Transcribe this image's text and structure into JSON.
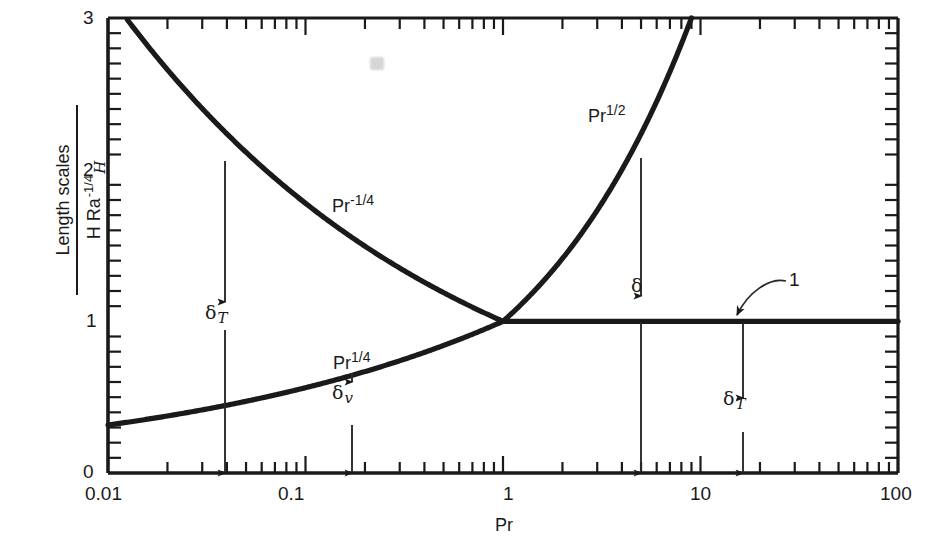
{
  "figure": {
    "background_color": "#ffffff",
    "line_color": "#1a1a1a"
  },
  "axes": {
    "x": {
      "label": "Pr",
      "scale": "log",
      "min": 0.01,
      "max": 100,
      "tick_labels": [
        "0.01",
        "0.1",
        "1",
        "10",
        "100"
      ],
      "tick_values": [
        0.01,
        0.1,
        1,
        10,
        100
      ]
    },
    "y": {
      "label_numerator": "Length scales",
      "label_denominator_base": "H Ra",
      "label_denominator_sub": "H",
      "label_denominator_sup": "-1/4",
      "scale": "linear",
      "min": 0,
      "max": 3,
      "tick_labels": [
        "0",
        "1",
        "2",
        "3"
      ],
      "tick_values": [
        0,
        1,
        2,
        3
      ]
    }
  },
  "curve_labels": {
    "upper": "Pr",
    "upper_exp": "-1/4",
    "lower": "Pr",
    "lower_exp": "1/4",
    "rising": "Pr",
    "rising_exp": "1/2"
  },
  "annotations": {
    "delta_T_left": "δ",
    "delta_T_left_sub": "T",
    "delta_v": "δ",
    "delta_v_sub": "v",
    "delta_mid": "δ",
    "delta_T_right": "δ",
    "delta_T_right_sub": "T",
    "unity_callout": "1"
  },
  "chart_data": {
    "type": "line",
    "title": "",
    "xlabel": "Pr",
    "ylabel": "Length scales / (H Ra_H^-1/4)",
    "xscale": "log",
    "yscale": "linear",
    "xlim": [
      0.01,
      100
    ],
    "ylim": [
      0,
      3
    ],
    "grid": false,
    "legend": "inline-curve-labels",
    "xtick_labels": [
      "0.01",
      "0.1",
      "1",
      "10",
      "100"
    ],
    "ytick_labels": [
      "0",
      "1",
      "2",
      "3"
    ],
    "series": [
      {
        "name": "Pr^-1/4",
        "formula": "y = Pr^(-1/4)",
        "role": "thermal boundary layer scale (low Pr branch)",
        "x": [
          0.01,
          0.0123,
          0.0152,
          0.0187,
          0.0231,
          0.0285,
          0.0352,
          0.0434,
          0.0536,
          0.0661,
          0.0816,
          0.1,
          0.155,
          0.239,
          0.369,
          0.57,
          0.88,
          1.0
        ],
        "y": [
          3.162,
          3.0,
          2.849,
          2.704,
          2.566,
          2.434,
          2.309,
          2.19,
          2.078,
          1.972,
          1.871,
          1.778,
          1.594,
          1.43,
          1.283,
          1.151,
          1.032,
          1.0
        ],
        "visible_from_x": 0.0123,
        "visible_to_x": 1.0
      },
      {
        "name": "Pr^1/4",
        "formula": "y = Pr^(1/4)",
        "role": "viscous boundary layer scale (low Pr branch)",
        "x": [
          0.01,
          0.0178,
          0.0316,
          0.0562,
          0.1,
          0.178,
          0.316,
          0.562,
          1.0
        ],
        "y": [
          0.316,
          0.365,
          0.422,
          0.487,
          0.562,
          0.649,
          0.75,
          0.866,
          1.0
        ],
        "visible_from_x": 0.01,
        "visible_to_x": 1.0
      },
      {
        "name": "Pr^1/2",
        "formula": "y = Pr^(1/2)",
        "role": "viscous boundary layer scale (high Pr branch)",
        "x": [
          1.0,
          1.5,
          2.0,
          3.0,
          4.0,
          5.0,
          6.0,
          7.0,
          8.0,
          9.0
        ],
        "y": [
          1.0,
          1.225,
          1.414,
          1.732,
          2.0,
          2.236,
          2.449,
          2.646,
          2.828,
          3.0
        ],
        "visible_from_x": 1.0,
        "visible_to_x": 9.0
      },
      {
        "name": "1",
        "formula": "y = 1",
        "role": "thermal boundary layer scale (high Pr branch), constant unity",
        "x": [
          1.0,
          100.0
        ],
        "y": [
          1.0,
          1.0
        ],
        "visible_from_x": 1.0,
        "visible_to_x": 100.0
      }
    ],
    "arrows": [
      {
        "label": "delta_T",
        "at_x": 0.055,
        "from_y": 0.0,
        "to_y": 2.1,
        "double_headed": true
      },
      {
        "label": "delta_v",
        "at_x": 0.18,
        "from_y": 0.0,
        "to_y": 0.65,
        "double_headed": true
      },
      {
        "label": "delta",
        "at_x": 4.5,
        "from_y": 0.0,
        "to_y": 2.12,
        "double_headed": true
      },
      {
        "label": "delta_T",
        "at_x": 21.0,
        "from_y": 0.0,
        "to_y": 1.0,
        "double_headed": true
      }
    ],
    "callouts": [
      {
        "text": "1",
        "points_to_x": 14.0,
        "points_to_y": 1.0
      }
    ]
  }
}
